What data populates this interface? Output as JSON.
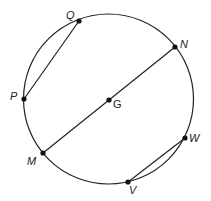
{
  "diagram": {
    "type": "circle-geometry",
    "colors": {
      "stroke": "#222222",
      "point": "#111111",
      "background": "#ffffff"
    },
    "circle": {
      "center_label": "G",
      "cx": 108.5,
      "cy": 99,
      "r": 85
    },
    "points": [
      {
        "id": "Q",
        "label": "Q",
        "x": 79,
        "y": 21,
        "lx": 66,
        "ly": 19
      },
      {
        "id": "P",
        "label": "P",
        "x": 24,
        "y": 99,
        "lx": 10,
        "ly": 100
      },
      {
        "id": "N",
        "label": "N",
        "x": 175,
        "y": 47,
        "lx": 180,
        "ly": 48
      },
      {
        "id": "G",
        "label": "G",
        "x": 109,
        "y": 100,
        "lx": 113,
        "ly": 108
      },
      {
        "id": "M",
        "label": "M",
        "x": 43,
        "y": 153,
        "lx": 27,
        "ly": 165
      },
      {
        "id": "W",
        "label": "W",
        "x": 185,
        "y": 138,
        "lx": 189,
        "ly": 142
      },
      {
        "id": "V",
        "label": "V",
        "x": 128,
        "y": 182,
        "lx": 129,
        "ly": 194
      }
    ],
    "segments": [
      {
        "name": "chord-PQ",
        "from": "P",
        "to": "Q"
      },
      {
        "name": "diameter-MN",
        "from": "M",
        "to": "N"
      },
      {
        "name": "chord-VW",
        "from": "V",
        "to": "W"
      }
    ]
  }
}
